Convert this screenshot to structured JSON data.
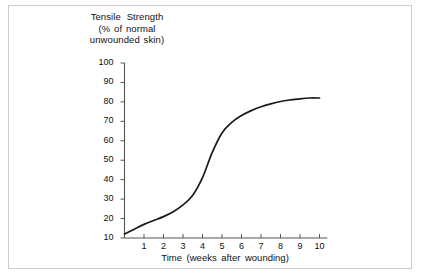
{
  "figure": {
    "background_color": "#ffffff",
    "frame_color": "#cccccc",
    "line_color": "#1a1a1a",
    "axis_color": "#555555"
  },
  "chart_data": {
    "type": "line",
    "title": "",
    "ylabel_lines": [
      "Tensile  Strength",
      "(% of normal",
      "unwounded  skin)"
    ],
    "xlabel": "Time  (weeks  after  wounding)",
    "xlim": [
      0,
      10.4
    ],
    "ylim": [
      10,
      100
    ],
    "grid": false,
    "legend": null,
    "yticks": [
      10,
      20,
      30,
      40,
      50,
      60,
      70,
      80,
      90,
      100
    ],
    "ytick_labels": [
      "10",
      "20",
      "30",
      "40",
      "50",
      "60",
      "70",
      "80",
      "90",
      "100"
    ],
    "xticks": [
      1,
      2,
      3,
      4,
      5,
      6,
      7,
      8,
      9,
      10
    ],
    "xtick_labels": [
      "1",
      "2",
      "3",
      "4",
      "5",
      "6",
      "7",
      "8",
      "9",
      "10"
    ],
    "series": [
      {
        "name": "Wound tensile strength",
        "x": [
          0,
          0.5,
          1,
          1.5,
          2,
          2.5,
          3,
          3.5,
          4,
          4.5,
          5,
          5.5,
          6,
          6.5,
          7,
          7.5,
          8,
          8.5,
          9,
          9.5,
          10
        ],
        "y": [
          12,
          14.5,
          17,
          19,
          21,
          23.5,
          27,
          32,
          41,
          54,
          64,
          69.5,
          73,
          75.5,
          77.5,
          79,
          80.2,
          81,
          81.6,
          82,
          82
        ]
      }
    ]
  }
}
